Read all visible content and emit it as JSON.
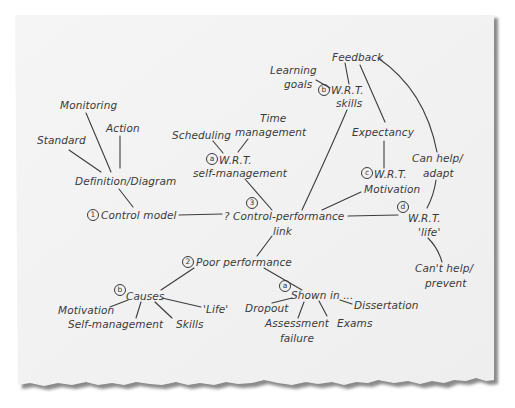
{
  "diagram": {
    "type": "mind-map",
    "style": "handwritten on torn paper",
    "nodes": {
      "monitoring": "Monitoring",
      "standard": "Standard",
      "action": "Action",
      "definition": "Definition/Diagram",
      "control_model": {
        "marker": "1",
        "label": "Control model"
      },
      "scheduling": "Scheduling",
      "time": "Time",
      "management": "management",
      "wrt_self": {
        "marker": "a",
        "line1": "W.R.T.",
        "line2": "self-management"
      },
      "central": {
        "marker": "3",
        "line1": "? Control-performance",
        "line2": "link"
      },
      "feedback": "Feedback",
      "learning": "Learning",
      "goals": "goals",
      "wrt_skills": {
        "marker": "b",
        "line1": "W.R.T.",
        "line2": "skills"
      },
      "expectancy": "Expectancy",
      "wrt_motivation": {
        "marker": "c",
        "line1": "W.R.T.",
        "line2": "Motivation"
      },
      "can_help": {
        "line1": "Can help/",
        "line2": "adapt"
      },
      "wrt_life": {
        "marker": "d",
        "line1": "W.R.T.",
        "line2": "'life'"
      },
      "cant_help": {
        "line1": "Can't help/",
        "line2": "prevent"
      },
      "poor_performance": {
        "marker": "2",
        "label": "Poor performance"
      },
      "causes": {
        "marker": "b",
        "label": "Causes"
      },
      "cause_motivation": "Motivation",
      "cause_self_management": "Self-management",
      "cause_skills": "Skills",
      "cause_life": "'Life'",
      "shown_in": {
        "marker": "a",
        "label": "Shown in ..."
      },
      "dropout": "Dropout",
      "assessment": {
        "line1": "Assessment",
        "line2": "failure"
      },
      "exams": "Exams",
      "dissertation": "Dissertation"
    },
    "edges": [
      [
        "standard",
        "definition"
      ],
      [
        "monitoring",
        "definition"
      ],
      [
        "action",
        "definition"
      ],
      [
        "definition",
        "control_model"
      ],
      [
        "control_model",
        "central"
      ],
      [
        "scheduling",
        "wrt_self"
      ],
      [
        "management",
        "wrt_self"
      ],
      [
        "wrt_self",
        "central"
      ],
      [
        "feedback",
        "wrt_skills"
      ],
      [
        "learning",
        "wrt_skills"
      ],
      [
        "wrt_skills",
        "central"
      ],
      [
        "feedback",
        "expectancy"
      ],
      [
        "expectancy",
        "wrt_motivation"
      ],
      [
        "wrt_motivation",
        "central"
      ],
      [
        "feedback",
        "can_help"
      ],
      [
        "can_help",
        "wrt_life"
      ],
      [
        "central",
        "wrt_life"
      ],
      [
        "wrt_life",
        "cant_help"
      ],
      [
        "central",
        "poor_performance"
      ],
      [
        "poor_performance",
        "causes"
      ],
      [
        "poor_performance",
        "shown_in"
      ],
      [
        "causes",
        "cause_motivation"
      ],
      [
        "causes",
        "cause_self_management"
      ],
      [
        "causes",
        "cause_skills"
      ],
      [
        "causes",
        "cause_life"
      ],
      [
        "shown_in",
        "dropout"
      ],
      [
        "shown_in",
        "assessment"
      ],
      [
        "shown_in",
        "exams"
      ],
      [
        "shown_in",
        "dissertation"
      ]
    ]
  },
  "colors": {
    "paper": "#f2f2f2",
    "ink": "#3a3a3a",
    "shadow": "#9a9a9a",
    "background": "#ffffff"
  }
}
